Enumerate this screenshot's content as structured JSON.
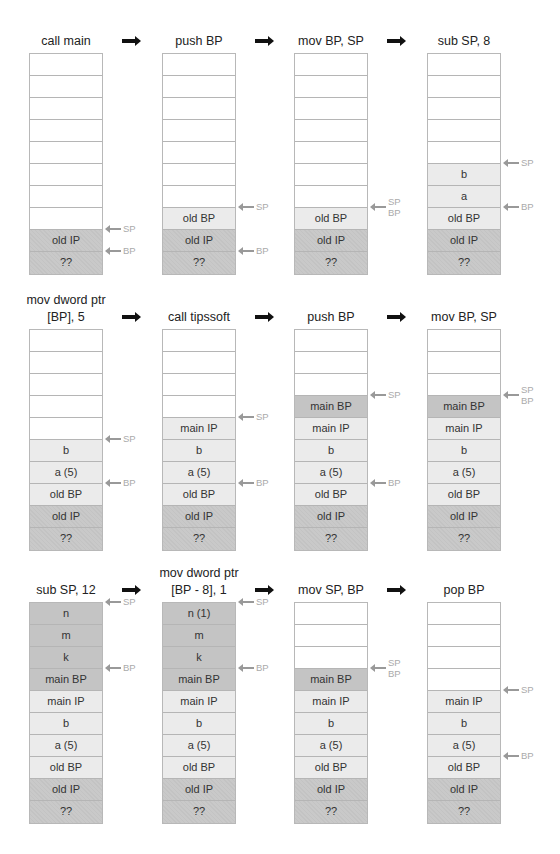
{
  "diagram": {
    "colors": {
      "empty": "#ffffff",
      "light": "#ebebeb",
      "mid": "#c4c4c4",
      "dark": "#c9c9c9",
      "pointer_label": "#aaaaaa",
      "flow_arrow": "#111111"
    },
    "rows": [
      {
        "steps": [
          {
            "title": [
              "call main"
            ],
            "cells": [
              "",
              "",
              "",
              "",
              "",
              "",
              "",
              "",
              "old IP",
              "??"
            ],
            "styles": [
              "empty",
              "empty",
              "empty",
              "empty",
              "empty",
              "empty",
              "empty",
              "empty",
              "dark",
              "dark"
            ],
            "pointers": [
              {
                "labels": [
                  "SP"
                ],
                "at": 8
              },
              {
                "labels": [
                  "BP"
                ],
                "at": 9
              }
            ]
          },
          {
            "title": [
              "push BP"
            ],
            "cells": [
              "",
              "",
              "",
              "",
              "",
              "",
              "",
              "old BP",
              "old IP",
              "??"
            ],
            "styles": [
              "empty",
              "empty",
              "empty",
              "empty",
              "empty",
              "empty",
              "empty",
              "light",
              "dark",
              "dark"
            ],
            "pointers": [
              {
                "labels": [
                  "SP"
                ],
                "at": 7
              },
              {
                "labels": [
                  "BP"
                ],
                "at": 9
              }
            ]
          },
          {
            "title": [
              "mov BP, SP"
            ],
            "cells": [
              "",
              "",
              "",
              "",
              "",
              "",
              "",
              "old BP",
              "old IP",
              "??"
            ],
            "styles": [
              "empty",
              "empty",
              "empty",
              "empty",
              "empty",
              "empty",
              "empty",
              "light",
              "dark",
              "dark"
            ],
            "pointers": [
              {
                "labels": [
                  "SP",
                  "BP"
                ],
                "at": 7
              }
            ]
          },
          {
            "title": [
              "sub SP, 8"
            ],
            "cells": [
              "",
              "",
              "",
              "",
              "",
              "b",
              "a",
              "old BP",
              "old IP",
              "??"
            ],
            "styles": [
              "empty",
              "empty",
              "empty",
              "empty",
              "empty",
              "light",
              "light",
              "light",
              "dark",
              "dark"
            ],
            "pointers": [
              {
                "labels": [
                  "SP"
                ],
                "at": 5
              },
              {
                "labels": [
                  "BP"
                ],
                "at": 7
              }
            ]
          }
        ]
      },
      {
        "steps": [
          {
            "title": [
              "mov dword ptr",
              "[BP], 5"
            ],
            "cells": [
              "",
              "",
              "",
              "",
              "",
              "b",
              "a (5)",
              "old BP",
              "old IP",
              "??"
            ],
            "styles": [
              "empty",
              "empty",
              "empty",
              "empty",
              "empty",
              "light",
              "light",
              "light",
              "dark",
              "dark"
            ],
            "pointers": [
              {
                "labels": [
                  "SP"
                ],
                "at": 5
              },
              {
                "labels": [
                  "BP"
                ],
                "at": 7
              }
            ]
          },
          {
            "title": [
              "call tipssoft"
            ],
            "cells": [
              "",
              "",
              "",
              "",
              "main IP",
              "b",
              "a (5)",
              "old BP",
              "old IP",
              "??"
            ],
            "styles": [
              "empty",
              "empty",
              "empty",
              "empty",
              "light",
              "light",
              "light",
              "light",
              "dark",
              "dark"
            ],
            "pointers": [
              {
                "labels": [
                  "SP"
                ],
                "at": 4
              },
              {
                "labels": [
                  "BP"
                ],
                "at": 7
              }
            ]
          },
          {
            "title": [
              "push BP"
            ],
            "cells": [
              "",
              "",
              "",
              "main BP",
              "main IP",
              "b",
              "a (5)",
              "old BP",
              "old IP",
              "??"
            ],
            "styles": [
              "empty",
              "empty",
              "empty",
              "mid",
              "light",
              "light",
              "light",
              "light",
              "dark",
              "dark"
            ],
            "pointers": [
              {
                "labels": [
                  "SP"
                ],
                "at": 3
              },
              {
                "labels": [
                  "BP"
                ],
                "at": 7
              }
            ]
          },
          {
            "title": [
              "mov BP, SP"
            ],
            "cells": [
              "",
              "",
              "",
              "main BP",
              "main IP",
              "b",
              "a (5)",
              "old BP",
              "old IP",
              "??"
            ],
            "styles": [
              "empty",
              "empty",
              "empty",
              "mid",
              "light",
              "light",
              "light",
              "light",
              "dark",
              "dark"
            ],
            "pointers": [
              {
                "labels": [
                  "SP",
                  "BP"
                ],
                "at": 3
              }
            ]
          }
        ]
      },
      {
        "steps": [
          {
            "title": [
              "sub SP, 12"
            ],
            "cells": [
              "n",
              "m",
              "k",
              "main BP",
              "main IP",
              "b",
              "a (5)",
              "old BP",
              "old IP",
              "??"
            ],
            "styles": [
              "mid",
              "mid",
              "mid",
              "mid",
              "light",
              "light",
              "light",
              "light",
              "dark",
              "dark"
            ],
            "pointers": [
              {
                "labels": [
                  "SP"
                ],
                "at": 0
              },
              {
                "labels": [
                  "BP"
                ],
                "at": 3
              }
            ]
          },
          {
            "title": [
              "mov dword ptr",
              "[BP - 8], 1"
            ],
            "cells": [
              "n (1)",
              "m",
              "k",
              "main BP",
              "main IP",
              "b",
              "a (5)",
              "old BP",
              "old IP",
              "??"
            ],
            "styles": [
              "mid",
              "mid",
              "mid",
              "mid",
              "light",
              "light",
              "light",
              "light",
              "dark",
              "dark"
            ],
            "pointers": [
              {
                "labels": [
                  "SP"
                ],
                "at": 0
              },
              {
                "labels": [
                  "BP"
                ],
                "at": 3
              }
            ]
          },
          {
            "title": [
              "mov SP, BP"
            ],
            "cells": [
              "",
              "",
              "",
              "main BP",
              "main IP",
              "b",
              "a (5)",
              "old BP",
              "old IP",
              "??"
            ],
            "styles": [
              "empty",
              "empty",
              "empty",
              "mid",
              "light",
              "light",
              "light",
              "light",
              "dark",
              "dark"
            ],
            "pointers": [
              {
                "labels": [
                  "SP",
                  "BP"
                ],
                "at": 3
              }
            ]
          },
          {
            "title": [
              "pop BP"
            ],
            "cells": [
              "",
              "",
              "",
              "",
              "main IP",
              "b",
              "a (5)",
              "old BP",
              "old IP",
              "??"
            ],
            "styles": [
              "empty",
              "empty",
              "empty",
              "empty",
              "light",
              "light",
              "light",
              "light",
              "dark",
              "dark"
            ],
            "pointers": [
              {
                "labels": [
                  "SP"
                ],
                "at": 4
              },
              {
                "labels": [
                  "BP"
                ],
                "at": 7
              }
            ]
          }
        ]
      }
    ]
  }
}
